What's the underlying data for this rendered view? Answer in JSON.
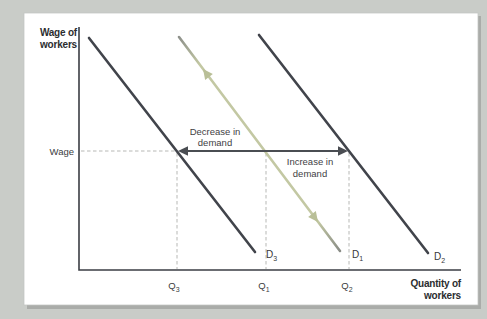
{
  "figure": {
    "y_axis_title_line1": "Wage of",
    "y_axis_title_line2": "workers",
    "x_axis_title_line1": "Quantity of",
    "x_axis_title_line2": "workers",
    "wage_tick": "Wage"
  },
  "annotations": {
    "decrease_line1": "Decrease in",
    "decrease_line2": "demand",
    "increase_line1": "Increase in",
    "increase_line2": "demand"
  },
  "ticks": {
    "q3_base": "Q",
    "q3_sub": "3",
    "q1_base": "Q",
    "q1_sub": "1",
    "q2_base": "Q",
    "q2_sub": "2"
  },
  "curve_labels": {
    "d3_base": "D",
    "d3_sub": "3",
    "d1_base": "D",
    "d1_sub": "1",
    "d2_base": "D",
    "d2_sub": "2"
  },
  "colors": {
    "page_background": "#c9ccc8",
    "panel": "#ffffff",
    "panel_shadow": "#aaaca9",
    "axis": "#3b3e44",
    "dark_line": "#41444b",
    "pale_line": "#c3c8a3",
    "pale_line_tip": "#8e918b",
    "shift_arrow": "#4a4d52",
    "dashed": "#b7b8b5"
  },
  "chart_data": {
    "type": "line",
    "title": "",
    "xlabel": "Quantity of workers",
    "ylabel": "Wage of workers",
    "x_ticks": [
      "Q3",
      "Q1",
      "Q2"
    ],
    "y_ticks": [
      "Wage"
    ],
    "annotations": [
      "Decrease in demand",
      "Increase in demand"
    ],
    "reference_lines": {
      "wage_level_y_px": 151,
      "q3_x_px": 177,
      "q1_x_px": 266,
      "q2_x_px": 349,
      "x_axis_y_px": 270,
      "y_axis_x_px": 79
    },
    "series": [
      {
        "name": "D3",
        "color": "#41444b",
        "points_px": [
          [
            89,
            38
          ],
          [
            255,
            252
          ]
        ],
        "crosses_wage_at": "Q3"
      },
      {
        "name": "D1",
        "color": "url(#paleGrad)",
        "points_px": [
          [
            179,
            37
          ],
          [
            340,
            251
          ]
        ],
        "crosses_wage_at": "Q1"
      },
      {
        "name": "D2",
        "color": "#41444b",
        "points_px": [
          [
            259,
            35
          ],
          [
            428,
            253
          ]
        ],
        "crosses_wage_at": "Q2"
      }
    ]
  }
}
